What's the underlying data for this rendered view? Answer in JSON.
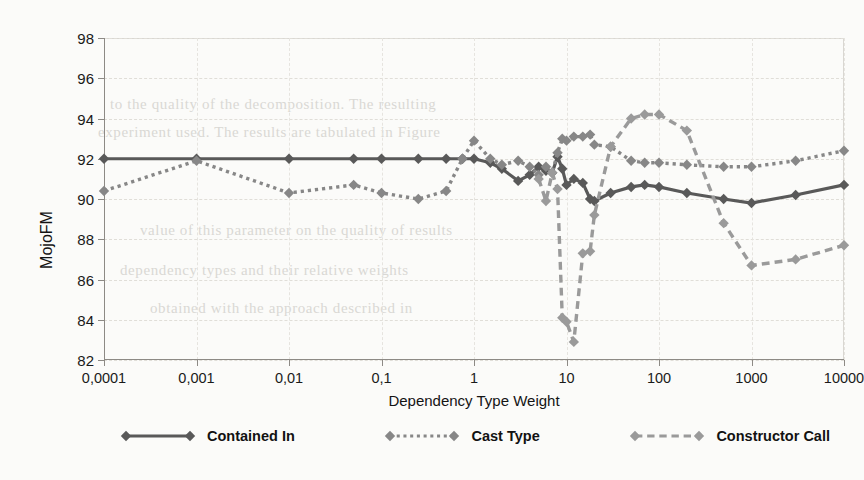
{
  "chart_data": {
    "type": "line",
    "title": "",
    "xlabel": "Dependency Type Weight",
    "ylabel": "MojoFM",
    "xscale": "log",
    "xlim": [
      0.0001,
      10000
    ],
    "ylim": [
      82,
      98
    ],
    "ytick_step": 2,
    "grid": true,
    "legend_position": "bottom",
    "xticks": [
      "0,0001",
      "0,001",
      "0,01",
      "0,1",
      "1",
      "10",
      "100",
      "1000",
      "10000"
    ],
    "xtick_values": [
      0.0001,
      0.001,
      0.01,
      0.1,
      1,
      10,
      100,
      1000,
      10000
    ],
    "yticks": [
      "82",
      "84",
      "86",
      "88",
      "90",
      "92",
      "94",
      "96",
      "98"
    ],
    "ytick_values": [
      82,
      84,
      86,
      88,
      90,
      92,
      94,
      96,
      98
    ],
    "series": [
      {
        "name": "Contained In",
        "color": "#595959",
        "style": "solid",
        "marker": "diamond",
        "x": [
          0.0001,
          0.001,
          0.01,
          0.05,
          0.1,
          0.25,
          0.5,
          0.75,
          1,
          1.5,
          2,
          3,
          4,
          5,
          6,
          7,
          8,
          9,
          10,
          12,
          15,
          18,
          20,
          30,
          50,
          70,
          100,
          200,
          500,
          1000,
          3000,
          10000
        ],
        "y": [
          92.0,
          92.0,
          92.0,
          92.0,
          92.0,
          92.0,
          92.0,
          92.0,
          92.0,
          91.8,
          91.5,
          90.9,
          91.2,
          91.6,
          91.4,
          91.3,
          92.1,
          91.5,
          90.7,
          91.0,
          90.8,
          90.0,
          89.9,
          90.3,
          90.6,
          90.7,
          90.6,
          90.3,
          90.0,
          89.8,
          90.2,
          90.7
        ]
      },
      {
        "name": "Cast Type",
        "color": "#878787",
        "style": "dotted",
        "marker": "diamond",
        "x": [
          0.0001,
          0.001,
          0.01,
          0.05,
          0.1,
          0.25,
          0.5,
          0.75,
          1,
          1.5,
          2,
          3,
          4,
          5,
          6,
          7,
          8,
          9,
          10,
          12,
          15,
          18,
          20,
          30,
          50,
          70,
          100,
          200,
          500,
          1000,
          3000,
          10000
        ],
        "y": [
          90.4,
          91.9,
          90.3,
          90.7,
          90.3,
          90.0,
          90.4,
          92.0,
          92.9,
          92.0,
          91.7,
          91.9,
          91.6,
          91.2,
          91.6,
          91.3,
          92.3,
          93.0,
          92.9,
          93.1,
          93.1,
          93.2,
          92.7,
          92.6,
          91.9,
          91.8,
          91.8,
          91.7,
          91.6,
          91.6,
          91.9,
          92.4
        ]
      },
      {
        "name": "Constructor Call",
        "color": "#9a9a9a",
        "style": "dashed",
        "marker": "diamond",
        "x": [
          5,
          6,
          7,
          8,
          9,
          10,
          12,
          15,
          18,
          20,
          30,
          50,
          70,
          100,
          200,
          500,
          1000,
          3000,
          10000
        ],
        "y": [
          91.0,
          89.9,
          91.3,
          90.5,
          84.1,
          83.9,
          82.9,
          87.3,
          87.4,
          89.2,
          92.6,
          94.0,
          94.2,
          94.2,
          93.4,
          88.8,
          86.7,
          87.0,
          87.7
        ]
      }
    ]
  },
  "axes": {
    "x_title": "Dependency Type Weight",
    "y_title": "MojoFM"
  },
  "legend": {
    "items": [
      {
        "label": "Contained In",
        "color": "#595959",
        "style": "solid"
      },
      {
        "label": "Cast Type",
        "color": "#878787",
        "style": "dotted"
      },
      {
        "label": "Constructor Call",
        "color": "#9a9a9a",
        "style": "dashed"
      }
    ]
  },
  "scan_artifacts": {
    "lines": [
      "to the quality of the decomposition. The resulting",
      "experiment used. The results are tabulated in Figure",
      "value of this parameter on the quality of results",
      "dependency types and their relative weights",
      "obtained with the approach described in"
    ]
  }
}
